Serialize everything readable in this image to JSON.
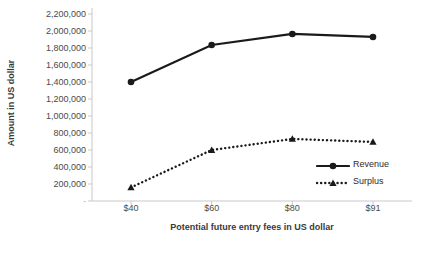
{
  "chart_data": {
    "type": "line",
    "title": "",
    "xlabel": "Potential future entry fees in US dollar",
    "ylabel": "Amount in US dollar",
    "categories": [
      "$40",
      "$60",
      "$80",
      "$91"
    ],
    "ylim": [
      0,
      2200000
    ],
    "ytick_step": 200000,
    "yticks": [
      {
        "value": 2200000,
        "label": "2,200,000"
      },
      {
        "value": 2000000,
        "label": "2,000,000"
      },
      {
        "value": 1800000,
        "label": "1,800,000"
      },
      {
        "value": 1600000,
        "label": "1,600,000"
      },
      {
        "value": 1400000,
        "label": "1,400,000"
      },
      {
        "value": 1200000,
        "label": "1,200,000"
      },
      {
        "value": 1000000,
        "label": "1,000,000"
      },
      {
        "value": 800000,
        "label": "800,000"
      },
      {
        "value": 600000,
        "label": "600,000"
      },
      {
        "value": 400000,
        "label": "400,000"
      },
      {
        "value": 200000,
        "label": "200,000"
      },
      {
        "value": 0,
        "label": "-"
      }
    ],
    "grid": false,
    "legend_position": "right-inside",
    "series": [
      {
        "name": "Revenue",
        "values": [
          1400000,
          1835000,
          1965000,
          1930000
        ],
        "line_style": "solid",
        "marker": "circle",
        "color": "#1a1a1a"
      },
      {
        "name": "Surplus",
        "values": [
          160000,
          600000,
          730000,
          695000
        ],
        "line_style": "dotted",
        "marker": "triangle",
        "color": "#1a1a1a"
      }
    ],
    "colors": {
      "axis": "#c9c9c9",
      "tick_text": "#4a4a4a",
      "title_text": "#3a3a3a",
      "series": "#1a1a1a",
      "background": "#ffffff"
    }
  }
}
